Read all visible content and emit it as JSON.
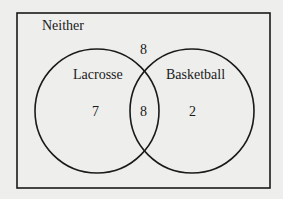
{
  "venn": {
    "universe_label": "Neither",
    "sets": [
      {
        "name": "Lacrosse",
        "only_count": "7"
      },
      {
        "name": "Basketball",
        "only_count": "2"
      }
    ],
    "intersection_count": "8",
    "neither_count": "8"
  }
}
